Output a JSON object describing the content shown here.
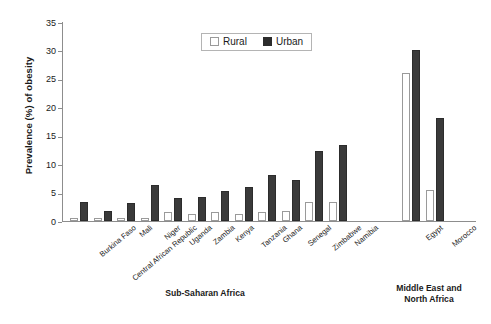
{
  "chart_data": {
    "type": "bar",
    "title": "",
    "subtitle": "",
    "xlabel": "",
    "ylabel": "Prevalence (%) of obesity",
    "ylim": [
      0,
      35
    ],
    "yticks": [
      0,
      5,
      10,
      15,
      20,
      25,
      30,
      35
    ],
    "grid": false,
    "legend_position": "top-center",
    "categories": [
      "Burkina Faso",
      "Central African Republic",
      "Mali",
      "Niger",
      "Uganda",
      "Zambia",
      "Kenya",
      "Tanzania",
      "Ghana",
      "Senegal",
      "Zimbabwe",
      "Namibia",
      "Egypt",
      "Morocco"
    ],
    "series": [
      {
        "name": "Rural",
        "color": "#ffffff",
        "edge_color": "#9a9a9a",
        "values": [
          0.5,
          0.5,
          0.6,
          0.5,
          1.6,
          1.3,
          1.6,
          1.3,
          1.5,
          1.8,
          3.3,
          3.4,
          26.0,
          5.5
        ]
      },
      {
        "name": "Urban",
        "color": "#2c2c2c",
        "edge_color": "#2c2c2c",
        "values": [
          3.4,
          1.8,
          3.2,
          6.3,
          4.1,
          4.3,
          5.3,
          5.9,
          8.1,
          7.2,
          12.4,
          13.3,
          30.0,
          18.2
        ]
      }
    ],
    "groups": [
      {
        "label": "Sub-Saharan Africa",
        "start": 0,
        "end": 11
      },
      {
        "label": "Middle East and\nNorth Africa",
        "line1": "Middle East and",
        "line2": "North Africa",
        "start": 12,
        "end": 13
      }
    ]
  },
  "legend": {
    "items": [
      {
        "label": "Rural",
        "swatch": "white-square-swatch"
      },
      {
        "label": "Urban",
        "swatch": "black-square-swatch"
      }
    ]
  },
  "axis": {
    "y_title": "Prevalence (%) of obesity",
    "y_tick_labels": [
      "0",
      "5",
      "10",
      "15",
      "20",
      "25",
      "30",
      "35"
    ]
  },
  "captions": {
    "sub_saharan_africa": "Sub-Saharan Africa",
    "mena_line1": "Middle East and",
    "mena_line2": "North Africa"
  }
}
